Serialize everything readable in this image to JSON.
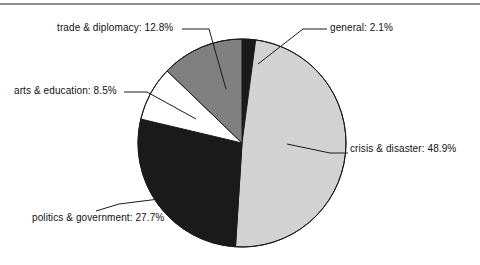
{
  "figure": {
    "title": "",
    "background_color": "#ffffff",
    "rule_color": "#8f8f8f",
    "text_color": "#111111"
  },
  "labels": {
    "general": "general: 2.1%",
    "crisis": "crisis & disaster: 48.9%",
    "politics": "politics & government: 27.7%",
    "arts": "arts & education: 8.5%",
    "trade": "trade & diplomacy: 12.8%"
  },
  "chart_data": {
    "type": "pie",
    "title": "",
    "xlabel": "",
    "ylabel": "",
    "legend_position": "none",
    "grid": false,
    "start_angle_deg": 90,
    "direction": "clockwise",
    "labels_format": "{name}: {percent}%",
    "center": [
      242,
      143
    ],
    "radius": 104,
    "categories": [
      "general",
      "crisis & disaster",
      "politics & government",
      "arts & education",
      "trade & diplomacy"
    ],
    "values": [
      2.1,
      48.9,
      27.7,
      8.5,
      12.8
    ],
    "colors": [
      "#1a1a1a",
      "#d2d2d2",
      "#1a1a1a",
      "#ffffff",
      "#808080"
    ],
    "slices": [
      {
        "name": "general",
        "percent": 2.1,
        "color": "#1a1a1a",
        "label": "general: 2.1%"
      },
      {
        "name": "crisis & disaster",
        "percent": 48.9,
        "color": "#d2d2d2",
        "label": "crisis & disaster: 48.9%"
      },
      {
        "name": "politics & government",
        "percent": 27.7,
        "color": "#1a1a1a",
        "label": "politics & government: 27.7%"
      },
      {
        "name": "arts & education",
        "percent": 8.5,
        "color": "#ffffff",
        "label": "arts & education: 8.5%"
      },
      {
        "name": "trade & diplomacy",
        "percent": 12.8,
        "color": "#808080",
        "label": "trade & diplomacy: 12.8%"
      }
    ],
    "total_percent": 100.0
  }
}
